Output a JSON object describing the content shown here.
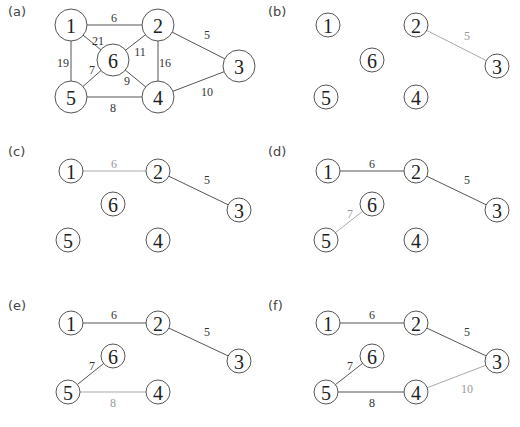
{
  "figure": {
    "panels": [
      {
        "label": "(a)",
        "ox": 0,
        "oy": 0,
        "r": 16,
        "nodes": [
          {
            "id": "1",
            "x": 71,
            "y": 25
          },
          {
            "id": "2",
            "x": 158,
            "y": 25
          },
          {
            "id": "3",
            "x": 239,
            "y": 66
          },
          {
            "id": "4",
            "x": 158,
            "y": 97
          },
          {
            "id": "5",
            "x": 71,
            "y": 97
          },
          {
            "id": "6",
            "x": 113,
            "y": 60
          }
        ],
        "edges": [
          {
            "from": "1",
            "to": "2",
            "w": "6",
            "lx": 114,
            "ly": 18,
            "color": "#555555"
          },
          {
            "from": "1",
            "to": "6",
            "w": "21",
            "lx": 98,
            "ly": 41,
            "color": "#555555"
          },
          {
            "from": "1",
            "to": "5",
            "w": "19",
            "lx": 63,
            "ly": 63,
            "color": "#555555"
          },
          {
            "from": "2",
            "to": "6",
            "w": "11",
            "lx": 140,
            "ly": 52,
            "color": "#555555"
          },
          {
            "from": "2",
            "to": "4",
            "w": "16",
            "lx": 165,
            "ly": 63,
            "color": "#555555"
          },
          {
            "from": "2",
            "to": "3",
            "w": "5",
            "lx": 207,
            "ly": 35,
            "color": "#555555"
          },
          {
            "from": "6",
            "to": "5",
            "w": "7",
            "lx": 92,
            "ly": 70,
            "color": "#555555"
          },
          {
            "from": "6",
            "to": "4",
            "w": "9",
            "lx": 127,
            "ly": 81,
            "color": "#555555"
          },
          {
            "from": "5",
            "to": "4",
            "w": "8",
            "lx": 113,
            "ly": 108,
            "color": "#555555"
          },
          {
            "from": "4",
            "to": "3",
            "w": "10",
            "lx": 207,
            "ly": 92,
            "color": "#555555"
          }
        ]
      },
      {
        "label": "(b)",
        "ox": 260,
        "oy": 0,
        "r": 12,
        "nodes": [
          {
            "id": "1",
            "x": 68,
            "y": 25
          },
          {
            "id": "2",
            "x": 156,
            "y": 25
          },
          {
            "id": "3",
            "x": 237,
            "y": 66
          },
          {
            "id": "4",
            "x": 156,
            "y": 97
          },
          {
            "id": "5",
            "x": 66,
            "y": 97
          },
          {
            "id": "6",
            "x": 112,
            "y": 60
          }
        ],
        "edges": [
          {
            "from": "2",
            "to": "3",
            "w": "5",
            "lx": 207,
            "ly": 36,
            "color": "#aaaaaa"
          }
        ]
      },
      {
        "label": "(c)",
        "ox": 0,
        "oy": 140,
        "r": 12,
        "nodes": [
          {
            "id": "1",
            "x": 71,
            "y": 31
          },
          {
            "id": "2",
            "x": 158,
            "y": 31
          },
          {
            "id": "3",
            "x": 239,
            "y": 70
          },
          {
            "id": "4",
            "x": 158,
            "y": 100
          },
          {
            "id": "5",
            "x": 68,
            "y": 100
          },
          {
            "id": "6",
            "x": 113,
            "y": 64
          }
        ],
        "edges": [
          {
            "from": "1",
            "to": "2",
            "w": "6",
            "lx": 114,
            "ly": 24,
            "color": "#aaaaaa"
          },
          {
            "from": "2",
            "to": "3",
            "w": "5",
            "lx": 207,
            "ly": 40,
            "color": "#555555"
          }
        ]
      },
      {
        "label": "(d)",
        "ox": 260,
        "oy": 140,
        "r": 12,
        "nodes": [
          {
            "id": "1",
            "x": 68,
            "y": 31
          },
          {
            "id": "2",
            "x": 156,
            "y": 31
          },
          {
            "id": "3",
            "x": 237,
            "y": 70
          },
          {
            "id": "4",
            "x": 156,
            "y": 100
          },
          {
            "id": "5",
            "x": 66,
            "y": 100
          },
          {
            "id": "6",
            "x": 112,
            "y": 64
          }
        ],
        "edges": [
          {
            "from": "1",
            "to": "2",
            "w": "6",
            "lx": 112,
            "ly": 24,
            "color": "#555555"
          },
          {
            "from": "2",
            "to": "3",
            "w": "5",
            "lx": 207,
            "ly": 40,
            "color": "#555555"
          },
          {
            "from": "5",
            "to": "6",
            "w": "7",
            "lx": 90,
            "ly": 74,
            "color": "#aaaaaa"
          }
        ]
      },
      {
        "label": "(e)",
        "ox": 0,
        "oy": 280,
        "r": 12,
        "nodes": [
          {
            "id": "1",
            "x": 71,
            "y": 43
          },
          {
            "id": "2",
            "x": 158,
            "y": 43
          },
          {
            "id": "3",
            "x": 239,
            "y": 81
          },
          {
            "id": "4",
            "x": 158,
            "y": 112
          },
          {
            "id": "5",
            "x": 68,
            "y": 112
          },
          {
            "id": "6",
            "x": 113,
            "y": 76
          }
        ],
        "edges": [
          {
            "from": "1",
            "to": "2",
            "w": "6",
            "lx": 114,
            "ly": 35,
            "color": "#555555"
          },
          {
            "from": "2",
            "to": "3",
            "w": "5",
            "lx": 207,
            "ly": 52,
            "color": "#555555"
          },
          {
            "from": "5",
            "to": "6",
            "w": "7",
            "lx": 92,
            "ly": 86,
            "color": "#555555"
          },
          {
            "from": "5",
            "to": "4",
            "w": "8",
            "lx": 113,
            "ly": 123,
            "color": "#aaaaaa"
          }
        ]
      },
      {
        "label": "(f)",
        "ox": 260,
        "oy": 280,
        "r": 12,
        "nodes": [
          {
            "id": "1",
            "x": 68,
            "y": 43
          },
          {
            "id": "2",
            "x": 156,
            "y": 43
          },
          {
            "id": "3",
            "x": 237,
            "y": 81
          },
          {
            "id": "4",
            "x": 156,
            "y": 112
          },
          {
            "id": "5",
            "x": 66,
            "y": 112
          },
          {
            "id": "6",
            "x": 112,
            "y": 76
          }
        ],
        "edges": [
          {
            "from": "1",
            "to": "2",
            "w": "6",
            "lx": 112,
            "ly": 35,
            "color": "#555555"
          },
          {
            "from": "2",
            "to": "3",
            "w": "5",
            "lx": 207,
            "ly": 52,
            "color": "#555555"
          },
          {
            "from": "5",
            "to": "6",
            "w": "7",
            "lx": 90,
            "ly": 86,
            "color": "#555555"
          },
          {
            "from": "5",
            "to": "4",
            "w": "8",
            "lx": 112,
            "ly": 123,
            "color": "#555555"
          },
          {
            "from": "4",
            "to": "3",
            "w": "10",
            "lx": 207,
            "ly": 109,
            "color": "#aaaaaa"
          }
        ]
      }
    ],
    "label_positions": [
      {
        "x": 8,
        "y": 16
      },
      {
        "x": 268,
        "y": 16
      },
      {
        "x": 8,
        "y": 156
      },
      {
        "x": 268,
        "y": 156
      },
      {
        "x": 8,
        "y": 310
      },
      {
        "x": 268,
        "y": 310
      }
    ]
  }
}
